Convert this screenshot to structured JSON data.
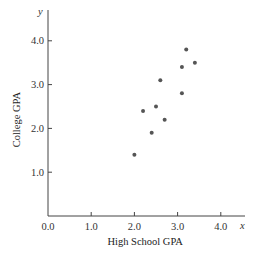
{
  "chart_data": {
    "type": "scatter",
    "title": "",
    "xlabel": "High School GPA",
    "ylabel": "College GPA",
    "x_var": "x",
    "y_var": "y",
    "xlim": [
      0,
      4.5
    ],
    "ylim": [
      0,
      4.4
    ],
    "x_ticks": [
      0.0,
      1.0,
      2.0,
      3.0,
      4.0
    ],
    "x_tick_labels": [
      "0.0",
      "1.0",
      "2.0",
      "3.0",
      "4.0"
    ],
    "y_ticks": [
      1.0,
      2.0,
      3.0,
      4.0
    ],
    "y_tick_labels": [
      "1.0",
      "2.0",
      "3.0",
      "4.0"
    ],
    "grid": false,
    "legend": "none",
    "point_color": "#555555",
    "series": [
      {
        "name": "students",
        "points": [
          {
            "x": 2.0,
            "y": 1.4
          },
          {
            "x": 2.2,
            "y": 2.4
          },
          {
            "x": 2.4,
            "y": 1.9
          },
          {
            "x": 2.5,
            "y": 2.5
          },
          {
            "x": 2.6,
            "y": 3.1
          },
          {
            "x": 2.7,
            "y": 2.2
          },
          {
            "x": 3.1,
            "y": 2.8
          },
          {
            "x": 3.1,
            "y": 3.4
          },
          {
            "x": 3.2,
            "y": 3.8
          },
          {
            "x": 3.4,
            "y": 3.5
          }
        ]
      }
    ]
  }
}
